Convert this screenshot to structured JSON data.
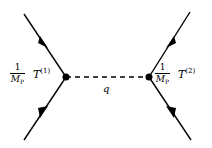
{
  "diagram": {
    "type": "feynman",
    "propagator": {
      "label": "q",
      "style": "dashed"
    },
    "left_vertex": {
      "coupling_numerator": "1",
      "coupling_denominator": "M",
      "coupling_denominator_sub": "P",
      "operator": "T",
      "operator_sup": "(1)"
    },
    "right_vertex": {
      "coupling_numerator": "1",
      "coupling_denominator": "M",
      "coupling_denominator_sub": "P",
      "operator": "T",
      "operator_sup": "(2)"
    },
    "colors": {
      "line": "#000000",
      "background": "#ffffff"
    }
  }
}
